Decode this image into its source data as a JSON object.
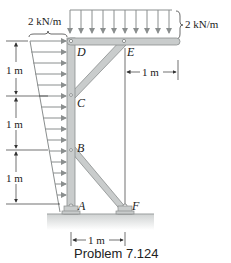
{
  "figure": {
    "caption": "Problem 7.124",
    "loads": {
      "top_distributed": "2 kN/m",
      "left_triangular": "2 kN/m"
    },
    "dimensions": {
      "left_segment_1": "1 m",
      "left_segment_2": "1 m",
      "left_segment_3": "1 m",
      "upper_right": "1 m",
      "bottom": "1 m"
    },
    "points": {
      "A": "A",
      "B": "B",
      "C": "C",
      "D": "D",
      "E": "E",
      "F": "F"
    },
    "colors": {
      "member_fill": "#c9cccc",
      "member_stroke": "#8a8e8e",
      "arrow": "#8a8e8e",
      "ground": "#d8dada",
      "text": "#222222"
    }
  }
}
